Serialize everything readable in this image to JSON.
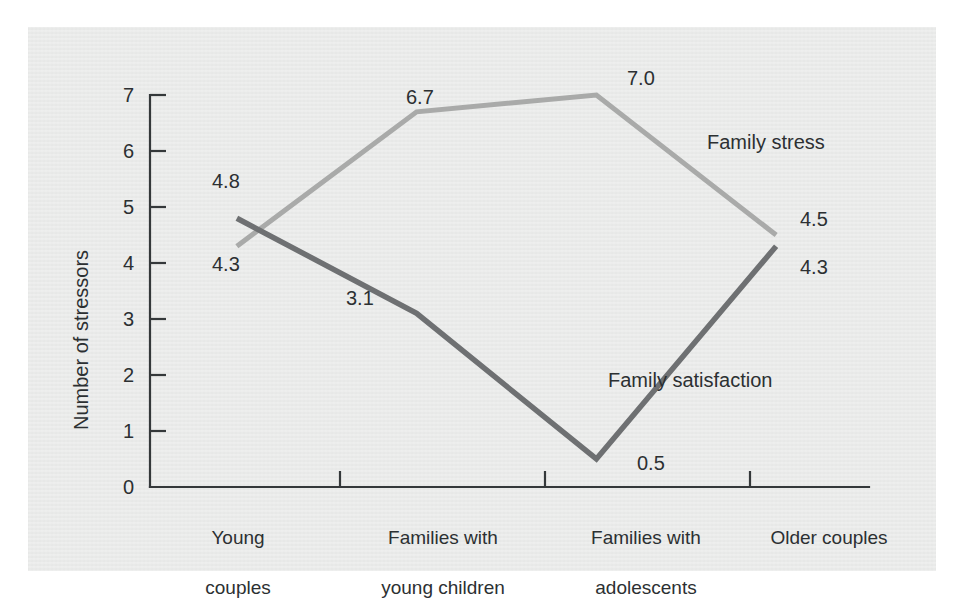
{
  "chart_data": {
    "type": "line",
    "title": "",
    "xlabel": "",
    "ylabel": "Number of stressors",
    "ylim": [
      0,
      7
    ],
    "yticks": [
      "0",
      "1",
      "2",
      "3",
      "4",
      "5",
      "6",
      "7"
    ],
    "grid": false,
    "legend_position": "inline-right",
    "categories": [
      "Young\ncouples",
      "Families with\nyoung children",
      "Families with\nadolescents",
      "Older couples"
    ],
    "series": [
      {
        "name": "Family stress",
        "color": "#a9aaa9",
        "values": [
          4.3,
          6.7,
          7.0,
          4.5
        ],
        "labels": [
          "4.3",
          "6.7",
          "7.0",
          "4.5"
        ]
      },
      {
        "name": "Family satisfaction",
        "color": "#6e7072",
        "values": [
          4.8,
          3.1,
          0.5,
          4.3
        ],
        "labels": [
          "4.8",
          "3.1",
          "0.5",
          "4.3"
        ]
      }
    ]
  },
  "colors": {
    "panel_background": "#e9eae9",
    "page_background": "#ffffff",
    "axis": "#34383a",
    "text": "#2c3032",
    "family_stress": "#a9aaa9",
    "family_satisfaction": "#6e7072"
  },
  "axis_labels": {
    "y_title": "Number of stressors",
    "y_ticks": [
      "7",
      "6",
      "5",
      "4",
      "3",
      "2",
      "1",
      "0"
    ],
    "x_categories": [
      {
        "line1": "Young",
        "line2": "couples"
      },
      {
        "line1": "Families with",
        "line2": "young children"
      },
      {
        "line1": "Families with",
        "line2": "adolescents"
      },
      {
        "line1": "Older couples",
        "line2": ""
      }
    ]
  },
  "annotations": {
    "stress_v1": "4.3",
    "stress_v2": "6.7",
    "stress_v3": "7.0",
    "stress_v4": "4.5",
    "satisfaction_v1": "4.8",
    "satisfaction_v2": "3.1",
    "satisfaction_v3": "0.5",
    "satisfaction_v4": "4.3",
    "stress_series_label": "Family stress",
    "satisfaction_series_label": "Family satisfaction"
  }
}
